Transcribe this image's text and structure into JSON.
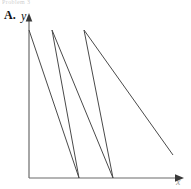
{
  "figure": {
    "clipped_header_text": "Problem 3",
    "panel_label": "A.",
    "background_color": "#ffffff"
  },
  "axes": {
    "y_label": "y",
    "x_label": "x",
    "axis_color": "#6b6b6b",
    "origin_x": 29,
    "origin_y": 178,
    "y_top": 14,
    "x_right": 183
  },
  "series": {
    "name": "sawtooth",
    "color": "#4a4a4a",
    "line_width": 1
  },
  "chart_data": {
    "type": "line",
    "title": "",
    "subtitle": "",
    "xlabel": "x",
    "ylabel": "y",
    "panel": "A.",
    "grid": false,
    "legend": false,
    "legend_position": "none",
    "axis_arrows": true,
    "xlim": [
      0,
      1
    ],
    "ylim": [
      0,
      1
    ],
    "xticks": [],
    "yticks": [],
    "xticklabels": [],
    "yticklabels": [],
    "annotations": [],
    "series": [
      {
        "name": "sawtooth",
        "color": "#4a4a4a",
        "points_px": [
          [
            29,
            30
          ],
          [
            79,
            178
          ],
          [
            52,
            30
          ],
          [
            113,
            178
          ],
          [
            84,
            30
          ],
          [
            173,
            155
          ]
        ],
        "x": [
          0.0,
          0.325,
          0.149,
          0.545,
          0.357,
          0.935
        ],
        "y": [
          1.0,
          0.0,
          1.0,
          0.0,
          1.0,
          0.155
        ],
        "description": "three descending ramps of a sawtooth-like wave with steep backward return strokes"
      }
    ]
  }
}
